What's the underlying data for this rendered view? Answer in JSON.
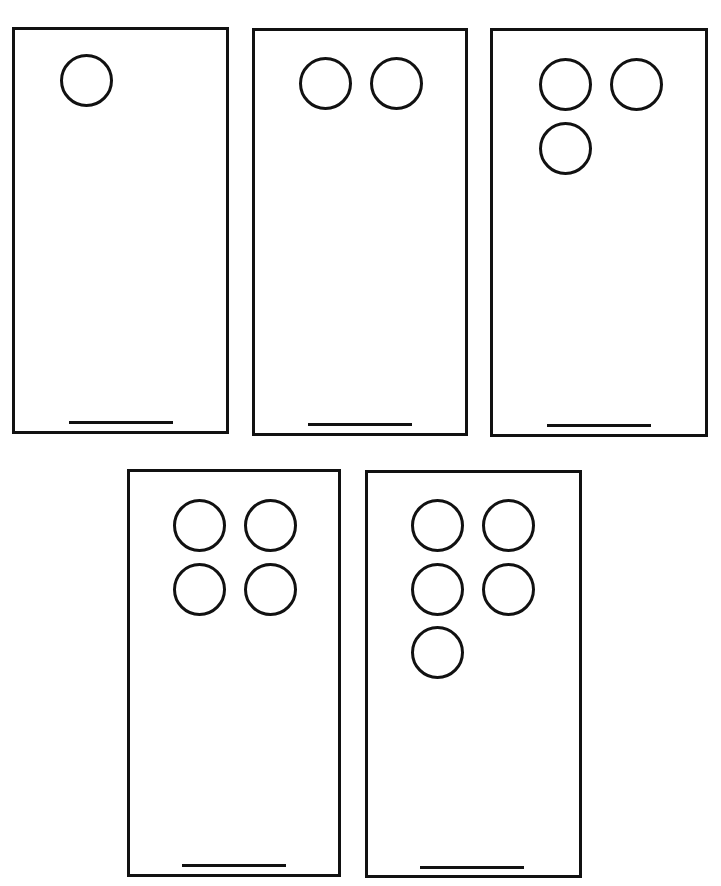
{
  "diagram": {
    "stroke_color": "#111111",
    "background_color": "#ffffff",
    "cards": [
      {
        "id": 1,
        "circle_count": 1,
        "rect": {
          "x": 12,
          "y": 27,
          "w": 217,
          "h": 407
        }
      },
      {
        "id": 2,
        "circle_count": 2,
        "rect": {
          "x": 252,
          "y": 28,
          "w": 216,
          "h": 408
        }
      },
      {
        "id": 3,
        "circle_count": 3,
        "rect": {
          "x": 490,
          "y": 28,
          "w": 218,
          "h": 409
        }
      },
      {
        "id": 4,
        "circle_count": 4,
        "rect": {
          "x": 127,
          "y": 469,
          "w": 214,
          "h": 408
        }
      },
      {
        "id": 5,
        "circle_count": 5,
        "rect": {
          "x": 365,
          "y": 470,
          "w": 217,
          "h": 408
        }
      }
    ]
  }
}
